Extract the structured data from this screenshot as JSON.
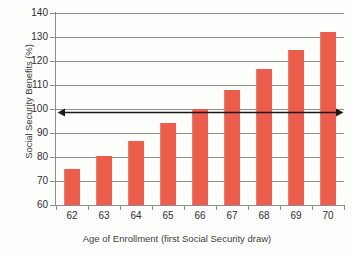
{
  "chart_data": {
    "type": "bar",
    "title": "",
    "subtitle": "",
    "xlabel": "Age of Enrollment (first Social Security draw)",
    "ylabel": "Social Security Benefits (%)",
    "categories": [
      "62",
      "63",
      "64",
      "65",
      "66",
      "67",
      "68",
      "69",
      "70"
    ],
    "values": [
      75,
      80.5,
      86.5,
      94,
      100,
      108,
      116.5,
      124.5,
      132
    ],
    "series": [
      {
        "name": "Social Security Benefits",
        "values": [
          75,
          80.5,
          86.5,
          94,
          100,
          108,
          116.5,
          124.5,
          132
        ]
      }
    ],
    "ylim": [
      60,
      140
    ],
    "ytick_labels": [
      "140",
      "130",
      "120",
      "110",
      "100",
      "90",
      "80",
      "70",
      "60"
    ],
    "ytick_values": [
      140,
      130,
      120,
      110,
      100,
      90,
      80,
      70,
      60
    ],
    "ytick_step": 10,
    "grid": true,
    "grid_axis": "y",
    "legend": false,
    "legend_position": "none",
    "bar_color": "#ec5d4e",
    "grid_color": "#8d8d8d",
    "axis_color": "#8d8d8d",
    "background_color": "#fdfdfc",
    "annotations": [
      {
        "name": "reference-arrow-100-percent",
        "type": "double-headed-arrow",
        "y_value": 100,
        "x_start": "62",
        "x_end": "70",
        "color": "#1a1a1a",
        "label": ""
      }
    ]
  }
}
